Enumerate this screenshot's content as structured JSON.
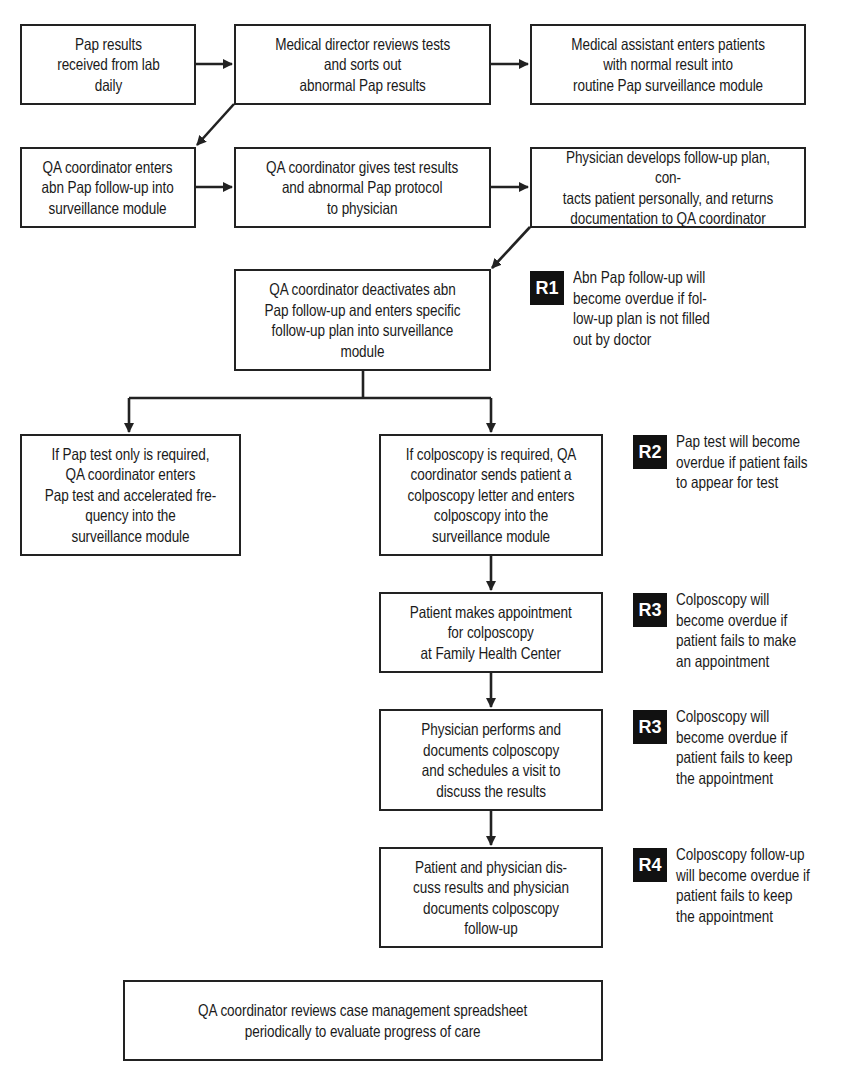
{
  "diagram": {
    "type": "flowchart",
    "boxes": {
      "pap_received": "Pap results\nreceived from lab\ndaily",
      "director_reviews": "Medical director reviews tests\nand sorts out\nabnormal Pap results",
      "assistant_enters": "Medical assistant enters patients\nwith normal result into\nroutine Pap surveillance module",
      "qa_enters": "QA coordinator enters\nabn Pap follow-up into\nsurveillance module",
      "qa_gives": "QA coordinator gives test results\nand abnormal Pap protocol\nto physician",
      "physician_develops": "Physician develops follow-up plan, con-\ntacts patient personally, and returns\ndocumentation to QA coordinator",
      "qa_deactivates": "QA coordinator deactivates abn\nPap follow-up and enters specific\nfollow-up plan into surveillance\nmodule",
      "pap_only": "If Pap test only is required,\nQA coordinator enters\nPap test and accelerated fre-\nquency into the\nsurveillance module",
      "colposcopy_required": "If colposcopy is required, QA\ncoordinator sends patient a\ncolposcopy letter and enters\ncolposcopy into the\nsurveillance module",
      "patient_appointment": "Patient makes appointment\nfor colposcopy\nat Family Health Center",
      "physician_performs": "Physician performs and\ndocuments colposcopy\nand schedules a visit to\ndiscuss the results",
      "discuss_results": "Patient and physician dis-\ncuss results and physician\ndocuments colposcopy\nfollow-up",
      "qa_reviews": "QA coordinator reviews case management spreadsheet\nperiodically to evaluate progress of care"
    },
    "notes": [
      {
        "badge": "R1",
        "text": "Abn Pap follow-up will\nbecome overdue if fol-\nlow-up plan is not filled\nout by doctor"
      },
      {
        "badge": "R2",
        "text": "Pap test will become\noverdue if patient fails\nto appear for test"
      },
      {
        "badge": "R3",
        "text": "Colposcopy will\nbecome overdue if\npatient fails to make\nan appointment"
      },
      {
        "badge": "R3",
        "text": "Colposcopy will\nbecome overdue if\npatient fails to keep\nthe appointment"
      },
      {
        "badge": "R4",
        "text": "Colposcopy follow-up\nwill become overdue if\npatient fails to keep\nthe appointment"
      }
    ],
    "colors": {
      "line": "#222222",
      "badge_bg": "#111111",
      "badge_text": "#ffffff"
    }
  }
}
